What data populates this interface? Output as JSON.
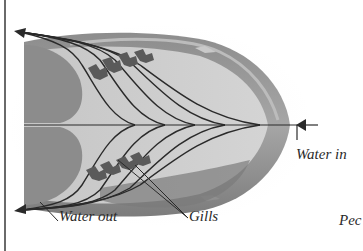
{
  "diagram": {
    "labels": {
      "water_in": "Water in",
      "water_out": "Water out",
      "gills": "Gills",
      "cut_off_text": "Pec"
    },
    "colors": {
      "background": "#ffffff",
      "body_dark": "#7a7a7a",
      "body_mid": "#9c9c9c",
      "body_light": "#cfcfcf",
      "inner_cavity": "#bdbdbd",
      "line": "#2a2a2a",
      "frame": "#6a6a6a"
    },
    "arrows": [
      {
        "name": "water-in-arrow",
        "direction": "left",
        "at": [
          300,
          125
        ]
      },
      {
        "name": "water-out-upper-arrow",
        "direction": "up-left",
        "at": [
          16,
          32
        ]
      },
      {
        "name": "water-out-lower-arrow",
        "direction": "down-left",
        "at": [
          16,
          209
        ]
      }
    ]
  }
}
